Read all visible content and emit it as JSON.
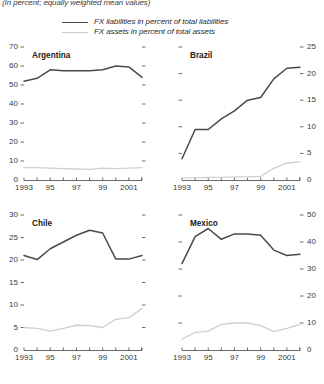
{
  "subtitle": "(In percent; equally weighted mean values)",
  "legend": [
    {
      "label": "FX liabilities in percent of total liabilities",
      "style": "solid-dark",
      "color": "#4a4a4a"
    },
    {
      "label": "FX assets in percent of total assets",
      "style": "solid-light",
      "color": "#cfcfcf"
    }
  ],
  "chart_data": [
    {
      "type": "line",
      "title": "Argentina",
      "xlabel": "",
      "ylabel": "",
      "axis_side": "left",
      "ylim": [
        0,
        70
      ],
      "yticks": [
        0,
        10,
        20,
        30,
        40,
        50,
        60,
        70
      ],
      "xlim": [
        1993,
        2002
      ],
      "x": [
        1993,
        1994,
        1995,
        1996,
        1997,
        1998,
        1999,
        2000,
        2001,
        2002
      ],
      "xticklabels": [
        "1993",
        "",
        "95",
        "",
        "97",
        "",
        "99",
        "",
        "2001",
        ""
      ],
      "grid": false,
      "series": [
        {
          "name": "FX liabilities in percent of total liabilities",
          "values": [
            52,
            53.5,
            58,
            57.5,
            57.5,
            57.5,
            58,
            60,
            59.5,
            54
          ]
        },
        {
          "name": "FX assets in percent of total assets",
          "values": [
            6.5,
            6.5,
            6.2,
            6.0,
            5.8,
            5.6,
            6.3,
            6.0,
            6.2,
            6.5
          ]
        }
      ]
    },
    {
      "type": "line",
      "title": "Brazil",
      "xlabel": "",
      "ylabel": "",
      "axis_side": "right",
      "ylim": [
        0,
        25
      ],
      "yticks": [
        0,
        5,
        10,
        15,
        20,
        25
      ],
      "xlim": [
        1993,
        2002
      ],
      "x": [
        1993,
        1994,
        1995,
        1996,
        1997,
        1998,
        1999,
        2000,
        2001,
        2002
      ],
      "xticklabels": [
        "1993",
        "",
        "95",
        "",
        "97",
        "",
        "99",
        "",
        "2001",
        ""
      ],
      "grid": false,
      "series": [
        {
          "name": "FX liabilities in percent of total liabilities",
          "values": [
            4,
            9.5,
            9.5,
            11.5,
            13,
            15,
            15.5,
            19,
            21,
            21.2
          ]
        },
        {
          "name": "FX assets in percent of total assets",
          "values": [
            0.4,
            0.4,
            0.5,
            0.5,
            0.6,
            0.6,
            0.7,
            2.2,
            3.2,
            3.4
          ]
        }
      ]
    },
    {
      "type": "line",
      "title": "Chile",
      "xlabel": "",
      "ylabel": "",
      "axis_side": "left",
      "ylim": [
        0,
        30
      ],
      "yticks": [
        0,
        5,
        10,
        15,
        20,
        25,
        30
      ],
      "xlim": [
        1993,
        2002
      ],
      "x": [
        1993,
        1994,
        1995,
        1996,
        1997,
        1998,
        1999,
        2000,
        2001,
        2002
      ],
      "xticklabels": [
        "1993",
        "",
        "95",
        "",
        "97",
        "",
        "99",
        "",
        "2001",
        ""
      ],
      "grid": false,
      "series": [
        {
          "name": "FX liabilities in percent of total liabilities",
          "values": [
            21,
            20.1,
            22.5,
            24,
            25.5,
            26.6,
            26,
            20.2,
            20.2,
            21
          ]
        },
        {
          "name": "FX assets in percent of total assets",
          "values": [
            5,
            4.8,
            4.2,
            4.8,
            5.5,
            5.4,
            5,
            6.8,
            7.2,
            9.2
          ]
        }
      ]
    },
    {
      "type": "line",
      "title": "Mexico",
      "xlabel": "",
      "ylabel": "",
      "axis_side": "right",
      "ylim": [
        0,
        50
      ],
      "yticks": [
        0,
        10,
        20,
        30,
        40,
        50
      ],
      "xlim": [
        1993,
        2002
      ],
      "x": [
        1993,
        1994,
        1995,
        1996,
        1997,
        1998,
        1999,
        2000,
        2001,
        2002
      ],
      "xticklabels": [
        "1993",
        "",
        "95",
        "",
        "97",
        "",
        "99",
        "",
        "2001",
        ""
      ],
      "grid": false,
      "series": [
        {
          "name": "FX liabilities in percent of total liabilities",
          "values": [
            32,
            42,
            45,
            41,
            43,
            43,
            42.5,
            37,
            35,
            35.5
          ]
        },
        {
          "name": "FX assets in percent of total assets",
          "values": [
            4,
            6.5,
            7,
            9.5,
            10,
            10,
            9,
            6.8,
            8,
            9.5
          ]
        }
      ]
    }
  ]
}
